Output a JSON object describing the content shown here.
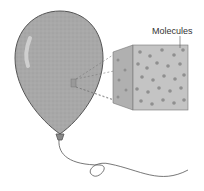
{
  "diagram": {
    "label": "Molecules",
    "colors": {
      "balloon_fill": "#a6a6a6",
      "cube_fill": "#b8b8b8",
      "molecule": "#8a8a8a",
      "outline": "#555555"
    }
  }
}
